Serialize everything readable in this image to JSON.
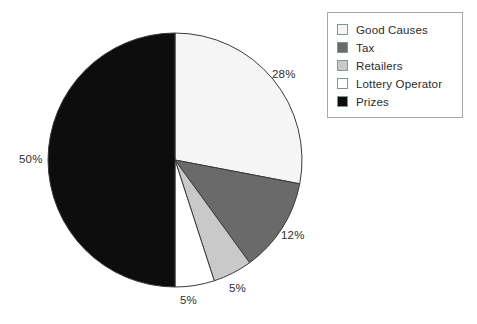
{
  "chart_data": {
    "type": "pie",
    "title": "",
    "categories": [
      "Good Causes",
      "Tax",
      "Retailers",
      "Lottery Operator",
      "Prizes"
    ],
    "values": [
      28,
      12,
      5,
      5,
      50
    ],
    "value_labels": [
      "28%",
      "12%",
      "5%",
      "5%",
      "50%"
    ],
    "unit": "%",
    "start_angle_deg": 0,
    "direction": "clockwise",
    "legend_position": "top-right",
    "grid": false,
    "colors": [
      "#f5f5f5",
      "#6a6a6a",
      "#c9c9c9",
      "#ffffff",
      "#0d0d0d"
    ],
    "slice_outline_color": "#3a3a3a"
  },
  "legend": {
    "items": [
      {
        "label": "Good Causes",
        "color": "#f5f5f5",
        "percent": "28%"
      },
      {
        "label": "Tax",
        "color": "#6a6a6a",
        "percent": "12%"
      },
      {
        "label": "Retailers",
        "color": "#c9c9c9",
        "percent": "5%"
      },
      {
        "label": "Lottery Operator",
        "color": "#ffffff",
        "percent": "5%"
      },
      {
        "label": "Prizes",
        "color": "#0d0d0d",
        "percent": "50%"
      }
    ]
  },
  "labels": {
    "good_causes": "28%",
    "tax": "12%",
    "retailers": "5%",
    "lottery_operator": "5%",
    "prizes": "50%"
  },
  "geometry": {
    "center_x": 175,
    "center_y": 160,
    "radius": 127
  }
}
